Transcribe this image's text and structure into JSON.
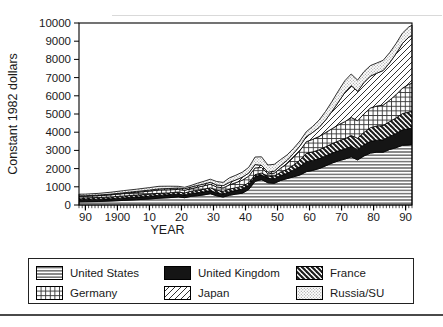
{
  "figure": {
    "background": "#ffffff",
    "ink_color": "#1a1a1a",
    "decorations": {
      "top_rule": true,
      "bottom_rule": true
    }
  },
  "chart_data": {
    "type": "area",
    "subtype": "stacked-area",
    "title": "",
    "xlabel": "YEAR",
    "ylabel": "Constant 1982 dollars",
    "xlim": [
      1888,
      1992
    ],
    "ylim": [
      0,
      10000
    ],
    "grid": false,
    "legend_position": "below",
    "y_ticks": [
      0,
      1000,
      2000,
      3000,
      4000,
      5000,
      6000,
      7000,
      8000,
      9000,
      10000
    ],
    "y_tick_labels": [
      "0",
      "1000",
      "2000",
      "3000",
      "4000",
      "5000",
      "6000",
      "7000",
      "8000",
      "9000",
      "10000"
    ],
    "x_tick_years": [
      1890,
      1900,
      1910,
      1920,
      1930,
      1940,
      1950,
      1960,
      1970,
      1980,
      1990
    ],
    "x_tick_labels": [
      "90",
      "1900",
      "10",
      "20",
      "30",
      "40",
      "50",
      "60",
      "70",
      "80",
      "90"
    ],
    "x_minor_tick_every_years": 1,
    "x": [
      1888,
      1890,
      1894,
      1898,
      1902,
      1906,
      1910,
      1913,
      1916,
      1919,
      1921,
      1923,
      1925,
      1927,
      1929,
      1931,
      1933,
      1935,
      1937,
      1939,
      1941,
      1943,
      1945,
      1947,
      1949,
      1951,
      1953,
      1955,
      1957,
      1959,
      1961,
      1963,
      1965,
      1967,
      1969,
      1971,
      1973,
      1975,
      1977,
      1979,
      1981,
      1983,
      1985,
      1987,
      1989,
      1991,
      1992
    ],
    "series": [
      {
        "name": "United States",
        "pattern": "horizontal-lines",
        "values": [
          178,
          180,
          195,
          220,
          255,
          290,
          330,
          375,
          400,
          445,
          400,
          480,
          510,
          555,
          620,
          505,
          440,
          535,
          600,
          650,
          850,
          1300,
          1400,
          1220,
          1190,
          1350,
          1450,
          1550,
          1650,
          1830,
          1900,
          2000,
          2150,
          2300,
          2430,
          2520,
          2650,
          2480,
          2700,
          2850,
          2900,
          2900,
          3050,
          3150,
          3280,
          3300,
          3330
        ]
      },
      {
        "name": "United Kingdom",
        "pattern": "solid",
        "values": [
          119,
          120,
          123,
          128,
          135,
          142,
          150,
          155,
          165,
          160,
          145,
          152,
          160,
          168,
          175,
          165,
          172,
          195,
          205,
          230,
          250,
          265,
          260,
          245,
          255,
          270,
          290,
          380,
          460,
          550,
          550,
          550,
          550,
          550,
          550,
          555,
          570,
          575,
          610,
          650,
          660,
          680,
          720,
          780,
          850,
          890,
          900
        ]
      },
      {
        "name": "France",
        "pattern": "diagonal-left",
        "values": [
          89,
          90,
          94,
          99,
          105,
          110,
          113,
          115,
          100,
          110,
          115,
          128,
          140,
          145,
          150,
          145,
          140,
          142,
          145,
          150,
          120,
          105,
          100,
          125,
          150,
          180,
          215,
          260,
          350,
          460,
          470,
          485,
          500,
          515,
          535,
          560,
          600,
          615,
          680,
          750,
          780,
          790,
          810,
          850,
          890,
          915,
          920
        ]
      },
      {
        "name": "Germany",
        "pattern": "grid",
        "values": [
          88,
          90,
          100,
          115,
          135,
          155,
          170,
          180,
          170,
          140,
          150,
          140,
          170,
          185,
          200,
          180,
          190,
          240,
          280,
          330,
          360,
          370,
          300,
          120,
          160,
          230,
          320,
          420,
          530,
          640,
          690,
          730,
          780,
          830,
          890,
          940,
          990,
          960,
          1020,
          1080,
          1100,
          1120,
          1180,
          1280,
          1400,
          1520,
          1550
        ]
      },
      {
        "name": "Japan",
        "pattern": "diagonal-right",
        "values": [
          29,
          30,
          33,
          37,
          42,
          48,
          55,
          60,
          70,
          80,
          85,
          88,
          95,
          100,
          105,
          110,
          120,
          135,
          150,
          165,
          175,
          180,
          120,
          90,
          110,
          140,
          180,
          220,
          250,
          275,
          380,
          500,
          680,
          950,
          1250,
          1600,
          1750,
          1620,
          1720,
          1750,
          1800,
          1900,
          2050,
          2250,
          2450,
          2600,
          2620
        ]
      },
      {
        "name": "Russia/SU",
        "pattern": "dots",
        "values": [
          89,
          90,
          95,
          105,
          118,
          125,
          140,
          145,
          130,
          90,
          75,
          90,
          125,
          150,
          165,
          185,
          180,
          245,
          260,
          275,
          310,
          420,
          470,
          400,
          370,
          330,
          300,
          280,
          275,
          275,
          330,
          400,
          480,
          550,
          620,
          650,
          640,
          610,
          600,
          580,
          560,
          560,
          560,
          560,
          570,
          560,
          560
        ]
      }
    ]
  },
  "legend": {
    "items": [
      {
        "label": "United States",
        "pattern": "horizontal-lines"
      },
      {
        "label": "United Kingdom",
        "pattern": "solid"
      },
      {
        "label": "France",
        "pattern": "diagonal-left"
      },
      {
        "label": "Germany",
        "pattern": "grid"
      },
      {
        "label": "Japan",
        "pattern": "diagonal-right"
      },
      {
        "label": "Russia/SU",
        "pattern": "dots"
      }
    ]
  }
}
